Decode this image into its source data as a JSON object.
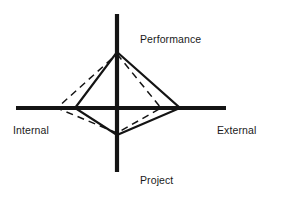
{
  "figure": {
    "width": 282,
    "height": 200,
    "background": "#ffffff",
    "ink_color": "#141414",
    "title": ""
  },
  "axes": {
    "center": {
      "x": 117,
      "y": 108
    },
    "vertical": {
      "x": 117,
      "y_top": 14,
      "y_bottom": 172,
      "stroke_width": 4.2
    },
    "horizontal": {
      "y": 108,
      "x_left": 16,
      "x_right": 226,
      "stroke_width": 4.2
    },
    "labels": {
      "up": "Performance",
      "right": "External",
      "down": "Project",
      "left": "Internal"
    }
  },
  "chart_data": {
    "type": "line",
    "title": "",
    "xlabel": "",
    "ylabel": "",
    "grid": false,
    "legend": "none",
    "axis_names": [
      "Performance",
      "External",
      "Project",
      "Internal"
    ],
    "axis_directions": [
      "up",
      "right",
      "down",
      "left"
    ],
    "axis_max_pixels": {
      "up": 94,
      "right": 109,
      "down": 64,
      "left": 101
    },
    "series": [
      {
        "name": "solid-profile",
        "style": "solid",
        "stroke": "#141414",
        "stroke_width": 2.2,
        "values": {
          "Performance": 0.6,
          "External": 0.58,
          "Project": 0.42,
          "Internal": 0.42
        },
        "vertices_px": [
          {
            "axis": "Performance",
            "x": 117,
            "y": 52
          },
          {
            "axis": "External",
            "x": 180,
            "y": 108
          },
          {
            "axis": "Project",
            "x": 117,
            "y": 135
          },
          {
            "axis": "Internal",
            "x": 75,
            "y": 108
          }
        ]
      },
      {
        "name": "dashed-profile",
        "style": "dashed",
        "stroke": "#141414",
        "stroke_width": 1.5,
        "dash_pattern": "7 5",
        "values": {
          "Performance": 0.58,
          "External": 0.4,
          "Project": 0.4,
          "Internal": 0.6
        },
        "vertices_px": [
          {
            "axis": "Performance",
            "x": 117,
            "y": 54
          },
          {
            "axis": "External",
            "x": 161,
            "y": 108
          },
          {
            "axis": "Project",
            "x": 117,
            "y": 133
          },
          {
            "axis": "Internal",
            "x": 57,
            "y": 108
          }
        ]
      }
    ]
  }
}
